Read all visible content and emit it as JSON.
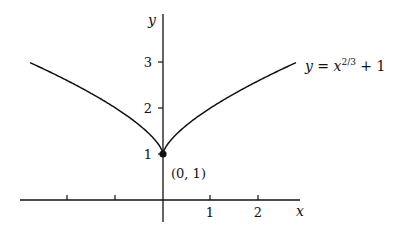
{
  "chart_data": {
    "type": "line",
    "title": "",
    "function": "y = x^(2/3) + 1",
    "xlabel": "x",
    "ylabel": "y",
    "xlim": [
      -3.0,
      2.9
    ],
    "ylim": [
      0,
      3.6
    ],
    "x_ticks": [
      -2,
      -1,
      1,
      2
    ],
    "x_tick_labels": [
      "",
      "",
      "1",
      "2"
    ],
    "y_ticks": [
      1,
      2,
      3
    ],
    "y_tick_labels": [
      "1",
      "2",
      "3"
    ],
    "grid": false,
    "series": [
      {
        "name": "y = x^{2/3} + 1",
        "x": [
          -2.8,
          -2.5,
          -2.0,
          -1.5,
          -1.0,
          -0.5,
          -0.2,
          -0.05,
          0,
          0.05,
          0.2,
          0.5,
          1.0,
          1.5,
          2.0,
          2.5,
          2.8
        ],
        "y": [
          2.99,
          2.84,
          2.59,
          2.31,
          2.0,
          1.63,
          1.34,
          1.14,
          1.0,
          1.14,
          1.34,
          1.63,
          2.0,
          2.31,
          2.59,
          2.84,
          2.99
        ]
      }
    ],
    "annotations": [
      {
        "text": "y = x^{2/3} + 1",
        "target": "curve right end"
      },
      {
        "text": "(0, 1)",
        "target": "point (0,1)",
        "marker": "filled-dot"
      }
    ]
  },
  "labels": {
    "x_axis": "x",
    "y_axis": "y",
    "y_tick_1": "1",
    "y_tick_2": "2",
    "y_tick_3": "3",
    "x_tick_1": "1",
    "x_tick_2": "2",
    "point_label": "(0, 1)",
    "curve_label_lhs": "y = x",
    "curve_label_exp": "2/3",
    "curve_label_rhs": " + 1"
  }
}
